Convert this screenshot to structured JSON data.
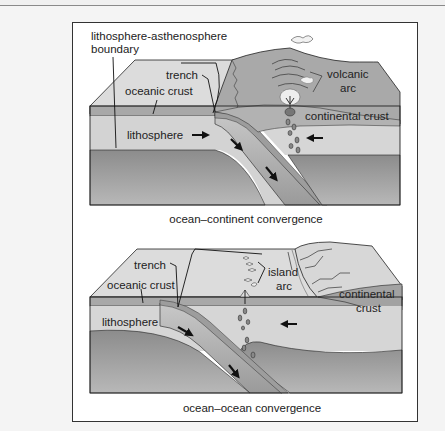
{
  "figure": {
    "panels": [
      {
        "id": "ocean-continent",
        "caption": "ocean–continent convergence",
        "labels": {
          "boundary_line1": "lithosphere-asthenosphere",
          "boundary_line2": "boundary",
          "trench": "trench",
          "oceanic_crust": "oceanic crust",
          "lithosphere": "lithosphere",
          "volcanic_line1": "volcanic",
          "volcanic_line2": "arc",
          "continental_crust": "continental crust"
        }
      },
      {
        "id": "ocean-ocean",
        "caption": "ocean–ocean convergence",
        "labels": {
          "trench": "trench",
          "oceanic_crust": "oceanic crust",
          "lithosphere": "lithosphere",
          "island_line1": "island",
          "island_line2": "arc",
          "continental_line1": "continental",
          "continental_line2": "crust"
        }
      }
    ],
    "icons": [
      "arrow-right-icon",
      "arrow-left-icon",
      "arrow-down-right-icon",
      "magma-blob-icon",
      "volcano-icon"
    ],
    "colors": {
      "surface": "#d9d9d9",
      "crust": "#a8a8a8",
      "lithosphere": "#d0d0d0",
      "asthenosphere": "#8f8f8f",
      "continent": "#b5b5b5",
      "outline": "#222222"
    }
  }
}
